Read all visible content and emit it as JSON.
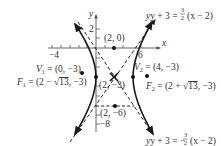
{
  "figure": {
    "type": "hyperbola graph",
    "axes": {
      "x_label": "x",
      "y_label": "y",
      "x_tick_labels": [
        "−4",
        "6"
      ],
      "y_tick_labels": [
        "2",
        "−8"
      ]
    },
    "points": {
      "p20": "(2, 0)",
      "center": "(2, −3)",
      "p2m6": "(2, −6)",
      "v1_name": "V",
      "v1_sub": "1",
      "v1_val": " = (0, −3)",
      "v2_name": "V",
      "v2_sub": "2",
      "v2_val": " = (4, −3)",
      "f1_name": "F",
      "f1_sub": "1",
      "f1_val_a": " = (2 − ",
      "f1_rad": "13",
      "f1_val_b": ", −3)",
      "f2_name": "F",
      "f2_sub": "2",
      "f2_val_a": " = (2 + ",
      "f2_rad": "13",
      "f2_val_b": ", −3)"
    },
    "asymptotes": {
      "upper_lhs": "y + 3 = ",
      "upper_num": "3",
      "upper_den": "2",
      "upper_rhs": "(x − 2)",
      "lower_lhs": "y + 3 = −",
      "lower_num": "3",
      "lower_den": "2",
      "lower_rhs": "(x − 2)"
    }
  }
}
